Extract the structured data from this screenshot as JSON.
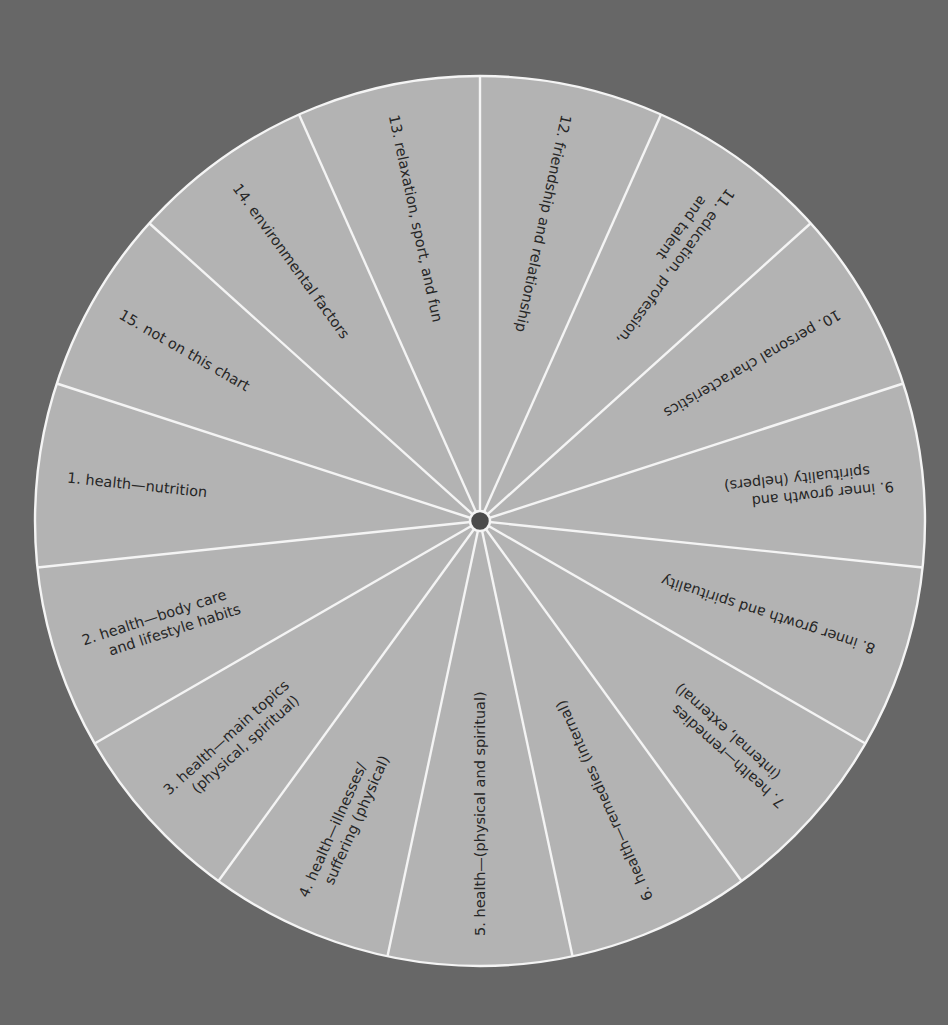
{
  "wheel": {
    "center": [
      480,
      521
    ],
    "radius": 445,
    "start_angle_deg": -90,
    "segment_count": 15,
    "colors": {
      "background": "#676767",
      "segment_fill": "#b3b3b3",
      "divider": "#f4f4f4",
      "hub": "#4a4a4a",
      "text": "#262626"
    },
    "hub_radius": 10,
    "segments": [
      {
        "number": "12.",
        "lines": [
          "friendship and relationship"
        ]
      },
      {
        "number": "11.",
        "lines": [
          "education, profession,",
          "and talent"
        ]
      },
      {
        "number": "10.",
        "lines": [
          "personal characteristics"
        ]
      },
      {
        "number": "9.",
        "lines": [
          "inner growth and",
          "spirituality (helpers)"
        ]
      },
      {
        "number": "8.",
        "lines": [
          "inner growth and spirituality"
        ]
      },
      {
        "number": "7.",
        "lines": [
          "health—remedies",
          "(internal, external)"
        ]
      },
      {
        "number": "6.",
        "lines": [
          "health—remedies (internal)"
        ]
      },
      {
        "number": "5.",
        "lines": [
          "health—(physical and spiritual)"
        ]
      },
      {
        "number": "4.",
        "lines": [
          "health—illnesses/",
          "suffering (physical)"
        ]
      },
      {
        "number": "3.",
        "lines": [
          "health—main topics",
          "(physical, spiritual)"
        ]
      },
      {
        "number": "2.",
        "lines": [
          "health—body care",
          "and lifestyle habits"
        ]
      },
      {
        "number": "1.",
        "lines": [
          "health—nutrition"
        ]
      },
      {
        "number": "15.",
        "lines": [
          "not on this chart"
        ]
      },
      {
        "number": "14.",
        "lines": [
          "environmental factors"
        ]
      },
      {
        "number": "13.",
        "lines": [
          "relaxation, sport, and fun"
        ]
      }
    ]
  },
  "chart_data": {
    "type": "pie",
    "title": "",
    "categories": [
      "1. health—nutrition",
      "2. health—body care and lifestyle habits",
      "3. health—main topics (physical, spiritual)",
      "4. health—illnesses/suffering (physical)",
      "5. health—(physical and spiritual)",
      "6. health—remedies (internal)",
      "7. health—remedies (internal, external)",
      "8. inner growth and spirituality",
      "9. inner growth and spirituality (helpers)",
      "10. personal characteristics",
      "11. education, profession, and talent",
      "12. friendship and relationship",
      "13. relaxation, sport, and fun",
      "14. environmental factors",
      "15. not on this chart"
    ],
    "values": [
      24,
      24,
      24,
      24,
      24,
      24,
      24,
      24,
      24,
      24,
      24,
      24,
      24,
      24,
      24
    ],
    "value_unit": "degrees per segment (equal slices)",
    "legend": "none (labels inside slices)"
  }
}
